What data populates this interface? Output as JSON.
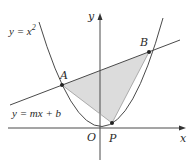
{
  "diagram": {
    "curves": {
      "parabola_label": "y = x",
      "parabola_exponent": "2",
      "line_label": "y = mx + b"
    },
    "axes": {
      "x_label": "x",
      "y_label": "y",
      "origin_label": "O"
    },
    "points": {
      "A": "A",
      "B": "B",
      "P": "P"
    },
    "colors": {
      "stroke": "#4a4a4a",
      "shade": "#dcdcdc",
      "point": "#222222"
    }
  }
}
